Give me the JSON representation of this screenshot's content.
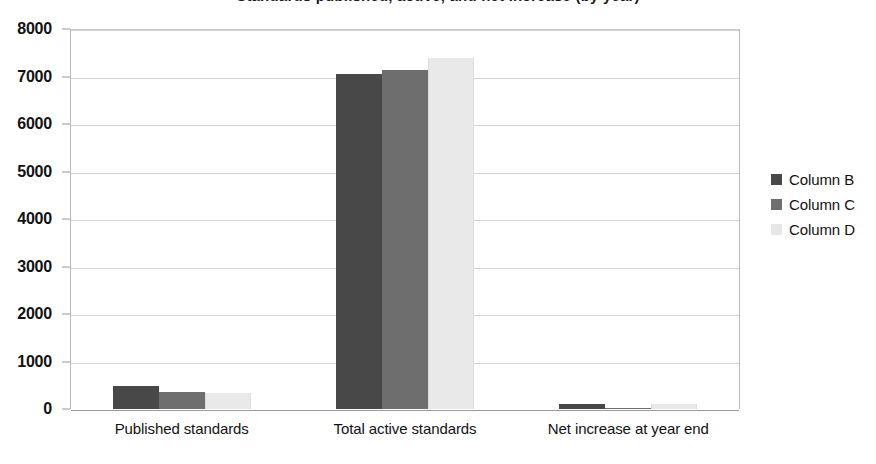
{
  "chart_data": {
    "type": "bar",
    "title": "Standards published, active, and net increase (by year)",
    "xlabel": "",
    "ylabel": "",
    "ylim": [
      0,
      8000
    ],
    "y_ticks": [
      0,
      1000,
      2000,
      3000,
      4000,
      5000,
      6000,
      7000,
      8000
    ],
    "y_tick_labels": [
      "0",
      "1000",
      "2000",
      "3000",
      "4000",
      "5000",
      "6000",
      "7000",
      "8000"
    ],
    "grid": true,
    "legend_position": "right",
    "categories": [
      "Published standards",
      "Total active standards",
      "Net increase at year end"
    ],
    "series": [
      {
        "name": "Column B",
        "color": "#484848",
        "values": [
          480,
          7050,
          110
        ]
      },
      {
        "name": "Column C",
        "color": "#6e6e6e",
        "values": [
          360,
          7140,
          20
        ]
      },
      {
        "name": "Column D",
        "color": "#e9e9e9",
        "values": [
          330,
          7400,
          110
        ]
      }
    ]
  },
  "legend": {
    "items": [
      {
        "label": "Column B",
        "swatch": "legend-swatch-series-b"
      },
      {
        "label": "Column C",
        "swatch": "legend-swatch-series-c"
      },
      {
        "label": "Column D",
        "swatch": "legend-swatch-series-d"
      }
    ]
  },
  "colors": {
    "series_b": "#484848",
    "series_c": "#6e6e6e",
    "series_d": "#e9e9e9",
    "gridline": "#d2d2d2",
    "axis": "#9a9a9a",
    "background": "#ffffff",
    "text": "#121212"
  }
}
